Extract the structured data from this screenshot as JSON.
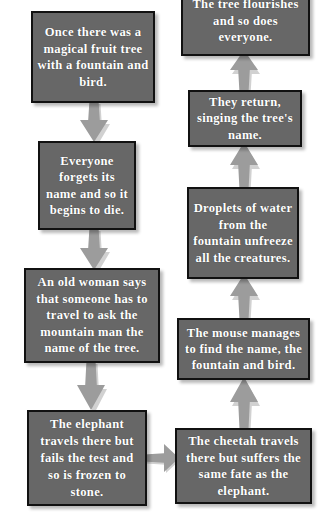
{
  "diagram": {
    "style": {
      "box_fill": "#676767",
      "box_border": "#111111",
      "text_color": "#ffffff",
      "arrow_color": "#9c9c9c",
      "background": "#ffffff"
    },
    "nodes": [
      {
        "id": "tree",
        "text": "Once there was a magical fruit tree with a fountain and bird."
      },
      {
        "id": "forget",
        "text": "Everyone forgets its name and so it begins to die."
      },
      {
        "id": "oldwoman",
        "text": "An old woman says that someone has to travel to ask the mountain man the name of the tree."
      },
      {
        "id": "elephant",
        "text": "The elephant travels there but fails the test and so is frozen to stone."
      },
      {
        "id": "cheetah",
        "text": "The cheetah travels there but suffers the same fate as the elephant."
      },
      {
        "id": "mouse",
        "text": "The mouse manages to find the name, the fountain and bird."
      },
      {
        "id": "droplets",
        "text": "Droplets of water from the fountain unfreeze all the creatures."
      },
      {
        "id": "return",
        "text": "They return, singing the tree's name."
      },
      {
        "id": "flourish",
        "text": "The tree flourishes and so does everyone."
      }
    ],
    "edges": [
      {
        "from": "tree",
        "to": "forget",
        "direction": "down"
      },
      {
        "from": "forget",
        "to": "oldwoman",
        "direction": "down"
      },
      {
        "from": "oldwoman",
        "to": "elephant",
        "direction": "down"
      },
      {
        "from": "elephant",
        "to": "cheetah",
        "direction": "right"
      },
      {
        "from": "cheetah",
        "to": "mouse",
        "direction": "up"
      },
      {
        "from": "mouse",
        "to": "droplets",
        "direction": "up"
      },
      {
        "from": "droplets",
        "to": "return",
        "direction": "up"
      },
      {
        "from": "return",
        "to": "flourish",
        "direction": "up"
      }
    ]
  }
}
